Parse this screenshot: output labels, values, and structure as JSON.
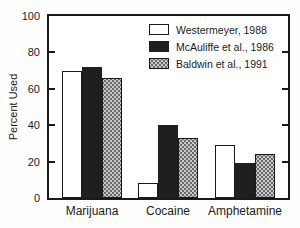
{
  "chart_data": {
    "type": "bar",
    "ylabel": "Percent Used",
    "xlabel": "",
    "ylim": [
      0,
      100
    ],
    "yticks": [
      0,
      20,
      40,
      60,
      80,
      100
    ],
    "categories": [
      "Marijuana",
      "Cocaine",
      "Amphetamine"
    ],
    "series": [
      {
        "name": "Westermeyer, 1988",
        "pattern": "open",
        "values": [
          70,
          8,
          29
        ]
      },
      {
        "name": "McAuliffe et al., 1986",
        "pattern": "solid",
        "values": [
          72,
          40,
          19
        ]
      },
      {
        "name": "Baldwin et al., 1991",
        "pattern": "halftone",
        "values": [
          66,
          33,
          24
        ]
      }
    ],
    "legend_position": "top-right",
    "grid": false
  },
  "colors": {
    "frame": "#1a1a1a",
    "text": "#1a1a1a",
    "bar_open_fill": "#ffffff",
    "bar_solid_fill": "#1f1f1f",
    "bar_halftone_fill": "#c9c9c9",
    "bar_halftone_dot": "#6a6a6a",
    "background": "#fefefe"
  }
}
